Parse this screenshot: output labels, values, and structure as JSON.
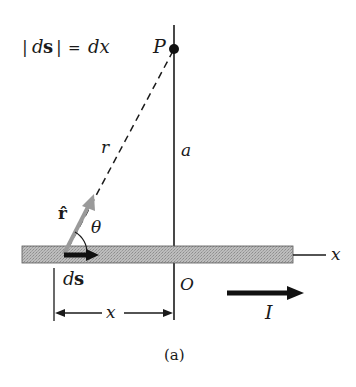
{
  "figure": {
    "equation": {
      "abs_bar_left": "|",
      "ds_d": "d",
      "ds_s": "s",
      "abs_bar_right": "|",
      "equals": "=",
      "rhs": "dx"
    },
    "labels": {
      "point": "P",
      "distance_r": "r",
      "distance_a": "a",
      "unit_vector": "r̂",
      "angle": "θ",
      "ds_d": "d",
      "ds_s": "s",
      "origin": "O",
      "x_dimension": "x",
      "x_axis": "x",
      "current": "I",
      "caption": "(a)"
    },
    "colors": {
      "ink": "#1a1a1a",
      "wire_fill": "#b8b8b8",
      "unit_vector_arrow": "#9a9a9a"
    }
  }
}
